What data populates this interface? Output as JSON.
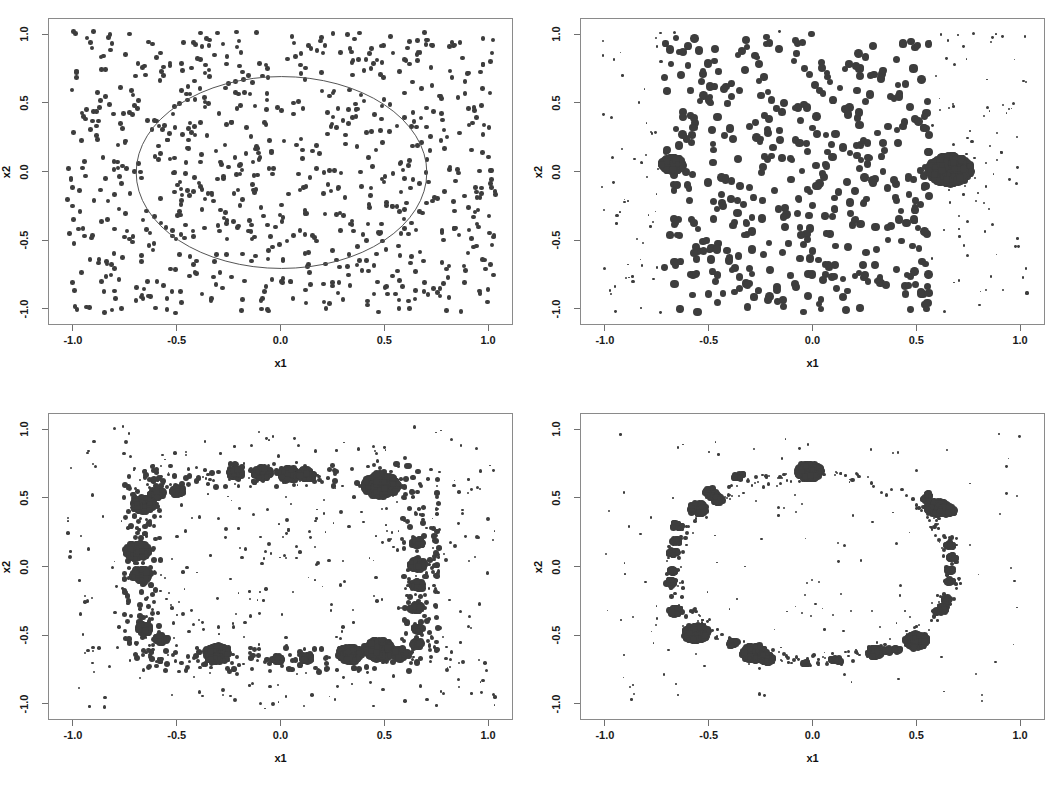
{
  "figure": {
    "width": 1061,
    "height": 795,
    "background": "#ffffff",
    "dot_color": "#3d3d3d",
    "frame_color": "#8a8a8a",
    "panel_count": 4,
    "layout": "2x2"
  },
  "axes": {
    "xlabel": "x1",
    "ylabel": "x2",
    "xticks": [
      "-1.0",
      "-0.5",
      "0.0",
      "0.5",
      "1.0"
    ],
    "yticks": [
      "-1.0",
      "-0.5",
      "0.0",
      "0.5",
      "1.0"
    ],
    "xtick_values": [
      -1.0,
      -0.5,
      0.0,
      0.5,
      1.0
    ],
    "ytick_values": [
      -1.0,
      -0.5,
      0.0,
      0.5,
      1.0
    ],
    "xlim": [
      -1.12,
      1.12
    ],
    "ylim": [
      -1.12,
      1.12
    ]
  },
  "chart_data": [
    {
      "panel": 1,
      "position": "top-left",
      "type": "scatter",
      "title": "",
      "xlabel": "x1",
      "ylabel": "x2",
      "xlim": [
        -1.12,
        1.12
      ],
      "ylim": [
        -1.12,
        1.12
      ],
      "xticks": [
        -1.0,
        -0.5,
        0.0,
        0.5,
        1.0
      ],
      "yticks": [
        -1.0,
        -0.5,
        0.0,
        0.5,
        1.0
      ],
      "grid": false,
      "legend": "none",
      "n_points": 820,
      "point_size_px": 4.6,
      "distribution": "uniform",
      "annotation": {
        "type": "ellipse",
        "cx": 0.0,
        "cy": 0.0,
        "rx": 0.7,
        "ry": 0.7,
        "stroke": "#555555",
        "stroke_width": 1
      },
      "seed": 11
    },
    {
      "panel": 2,
      "position": "top-right",
      "type": "scatter",
      "title": "",
      "xlabel": "x1",
      "ylabel": "x2",
      "xlim": [
        -1.12,
        1.12
      ],
      "ylim": [
        -1.12,
        1.12
      ],
      "xticks": [
        -1.0,
        -0.5,
        0.0,
        0.5,
        1.0
      ],
      "yticks": [
        -1.0,
        -0.5,
        0.0,
        0.5,
        1.0
      ],
      "grid": false,
      "legend": "none",
      "n_points": 900,
      "distribution": "weighted-rectangle",
      "core_region": {
        "xmin": -0.72,
        "xmax": 0.56,
        "ymin": -1.02,
        "ymax": 1.02
      },
      "core_point_size_px": 7.2,
      "tail_point_size_px": 2.0,
      "blobs": [
        {
          "cx": -0.68,
          "cy": 0.06,
          "r": 0.055,
          "n": 120
        },
        {
          "cx": 0.655,
          "cy": 0.02,
          "r": 0.105,
          "n": 520
        }
      ],
      "seed": 23
    },
    {
      "panel": 3,
      "position": "bottom-left",
      "type": "scatter",
      "title": "",
      "xlabel": "x1",
      "ylabel": "x2",
      "xlim": [
        -1.12,
        1.12
      ],
      "ylim": [
        -1.12,
        1.12
      ],
      "xticks": [
        -1.0,
        -0.5,
        0.0,
        0.5,
        1.0
      ],
      "yticks": [
        -1.0,
        -0.5,
        0.0,
        0.5,
        1.0
      ],
      "grid": false,
      "legend": "none",
      "distribution": "square-ring",
      "ring": {
        "half_width": 0.67,
        "thickness": 0.09
      },
      "background_points": 430,
      "background_point_size_px": 2.2,
      "blobs": [
        {
          "cx": -0.22,
          "cy": 0.69,
          "r": 0.035,
          "n": 60
        },
        {
          "cx": -0.09,
          "cy": 0.69,
          "r": 0.045,
          "n": 90
        },
        {
          "cx": 0.04,
          "cy": 0.68,
          "r": 0.048,
          "n": 100
        },
        {
          "cx": 0.12,
          "cy": 0.68,
          "r": 0.04,
          "n": 70
        },
        {
          "cx": 0.48,
          "cy": 0.6,
          "r": 0.085,
          "n": 280
        },
        {
          "cx": -0.665,
          "cy": 0.46,
          "r": 0.055,
          "n": 130
        },
        {
          "cx": -0.6,
          "cy": 0.54,
          "r": 0.035,
          "n": 60
        },
        {
          "cx": -0.5,
          "cy": 0.56,
          "r": 0.03,
          "n": 45
        },
        {
          "cx": -0.695,
          "cy": 0.12,
          "r": 0.06,
          "n": 170
        },
        {
          "cx": -0.675,
          "cy": -0.05,
          "r": 0.045,
          "n": 100
        },
        {
          "cx": -0.66,
          "cy": -0.45,
          "r": 0.035,
          "n": 55
        },
        {
          "cx": -0.58,
          "cy": -0.52,
          "r": 0.03,
          "n": 45
        },
        {
          "cx": -0.31,
          "cy": -0.63,
          "r": 0.06,
          "n": 150
        },
        {
          "cx": -0.02,
          "cy": -0.67,
          "r": 0.025,
          "n": 30
        },
        {
          "cx": 0.12,
          "cy": -0.66,
          "r": 0.03,
          "n": 38
        },
        {
          "cx": 0.33,
          "cy": -0.63,
          "r": 0.058,
          "n": 150
        },
        {
          "cx": 0.47,
          "cy": -0.6,
          "r": 0.072,
          "n": 220
        },
        {
          "cx": 0.57,
          "cy": -0.63,
          "r": 0.04,
          "n": 70
        },
        {
          "cx": 0.655,
          "cy": 0.18,
          "r": 0.028,
          "n": 35
        },
        {
          "cx": 0.655,
          "cy": 0.02,
          "r": 0.038,
          "n": 60
        },
        {
          "cx": 0.655,
          "cy": -0.13,
          "r": 0.03,
          "n": 40
        },
        {
          "cx": 0.645,
          "cy": -0.29,
          "r": 0.03,
          "n": 40
        },
        {
          "cx": 0.66,
          "cy": -0.45,
          "r": 0.022,
          "n": 25
        },
        {
          "cx": 0.655,
          "cy": -0.56,
          "r": 0.026,
          "n": 30
        }
      ],
      "seed": 37
    },
    {
      "panel": 4,
      "position": "bottom-right",
      "type": "scatter",
      "title": "",
      "xlabel": "x1",
      "ylabel": "x2",
      "xlim": [
        -1.12,
        1.12
      ],
      "ylim": [
        -1.12,
        1.12
      ],
      "xticks": [
        -1.0,
        -0.5,
        0.0,
        0.5,
        1.0
      ],
      "yticks": [
        -1.0,
        -0.5,
        0.0,
        0.5,
        1.0
      ],
      "grid": false,
      "legend": "none",
      "distribution": "circular-ring",
      "ring": {
        "cx": 0.0,
        "cy": 0.0,
        "radius": 0.675,
        "thickness": 0.045
      },
      "background_points": 150,
      "background_point_size_px": 1.8,
      "blobs": [
        {
          "cx": -0.02,
          "cy": 0.7,
          "r": 0.062,
          "n": 220
        },
        {
          "cx": -0.36,
          "cy": 0.665,
          "r": 0.026,
          "n": 35
        },
        {
          "cx": -0.5,
          "cy": 0.555,
          "r": 0.024,
          "n": 30
        },
        {
          "cx": -0.475,
          "cy": 0.52,
          "r": 0.026,
          "n": 32
        },
        {
          "cx": -0.46,
          "cy": 0.495,
          "r": 0.024,
          "n": 28
        },
        {
          "cx": -0.555,
          "cy": 0.43,
          "r": 0.044,
          "n": 95
        },
        {
          "cx": -0.655,
          "cy": 0.305,
          "r": 0.026,
          "n": 34
        },
        {
          "cx": -0.665,
          "cy": 0.19,
          "r": 0.022,
          "n": 26
        },
        {
          "cx": -0.675,
          "cy": 0.11,
          "r": 0.022,
          "n": 26
        },
        {
          "cx": -0.68,
          "cy": -0.03,
          "r": 0.02,
          "n": 22
        },
        {
          "cx": -0.685,
          "cy": -0.11,
          "r": 0.024,
          "n": 28
        },
        {
          "cx": -0.665,
          "cy": -0.32,
          "r": 0.032,
          "n": 45
        },
        {
          "cx": -0.565,
          "cy": -0.48,
          "r": 0.062,
          "n": 200
        },
        {
          "cx": -0.385,
          "cy": -0.555,
          "r": 0.024,
          "n": 28
        },
        {
          "cx": -0.285,
          "cy": -0.625,
          "r": 0.06,
          "n": 190
        },
        {
          "cx": -0.225,
          "cy": -0.665,
          "r": 0.035,
          "n": 60
        },
        {
          "cx": -0.035,
          "cy": -0.695,
          "r": 0.016,
          "n": 14
        },
        {
          "cx": 0.095,
          "cy": -0.675,
          "r": 0.016,
          "n": 14
        },
        {
          "cx": 0.125,
          "cy": -0.675,
          "r": 0.016,
          "n": 14
        },
        {
          "cx": 0.295,
          "cy": -0.62,
          "r": 0.036,
          "n": 60
        },
        {
          "cx": 0.355,
          "cy": -0.605,
          "r": 0.02,
          "n": 20
        },
        {
          "cx": 0.405,
          "cy": -0.6,
          "r": 0.018,
          "n": 18
        },
        {
          "cx": 0.495,
          "cy": -0.535,
          "r": 0.055,
          "n": 160
        },
        {
          "cx": 0.6,
          "cy": 0.435,
          "r": 0.055,
          "n": 160
        },
        {
          "cx": 0.645,
          "cy": 0.415,
          "r": 0.038,
          "n": 70
        },
        {
          "cx": 0.54,
          "cy": 0.5,
          "r": 0.018,
          "n": 18
        },
        {
          "cx": 0.555,
          "cy": 0.53,
          "r": 0.014,
          "n": 12
        },
        {
          "cx": 0.655,
          "cy": 0.165,
          "r": 0.018,
          "n": 18
        },
        {
          "cx": 0.67,
          "cy": 0.075,
          "r": 0.018,
          "n": 18
        },
        {
          "cx": 0.66,
          "cy": -0.02,
          "r": 0.018,
          "n": 18
        },
        {
          "cx": 0.655,
          "cy": -0.1,
          "r": 0.016,
          "n": 14
        },
        {
          "cx": 0.64,
          "cy": -0.235,
          "r": 0.018,
          "n": 18
        },
        {
          "cx": 0.625,
          "cy": -0.3,
          "r": 0.022,
          "n": 24
        },
        {
          "cx": 0.6,
          "cy": -0.325,
          "r": 0.016,
          "n": 14
        }
      ],
      "seed": 53
    }
  ]
}
